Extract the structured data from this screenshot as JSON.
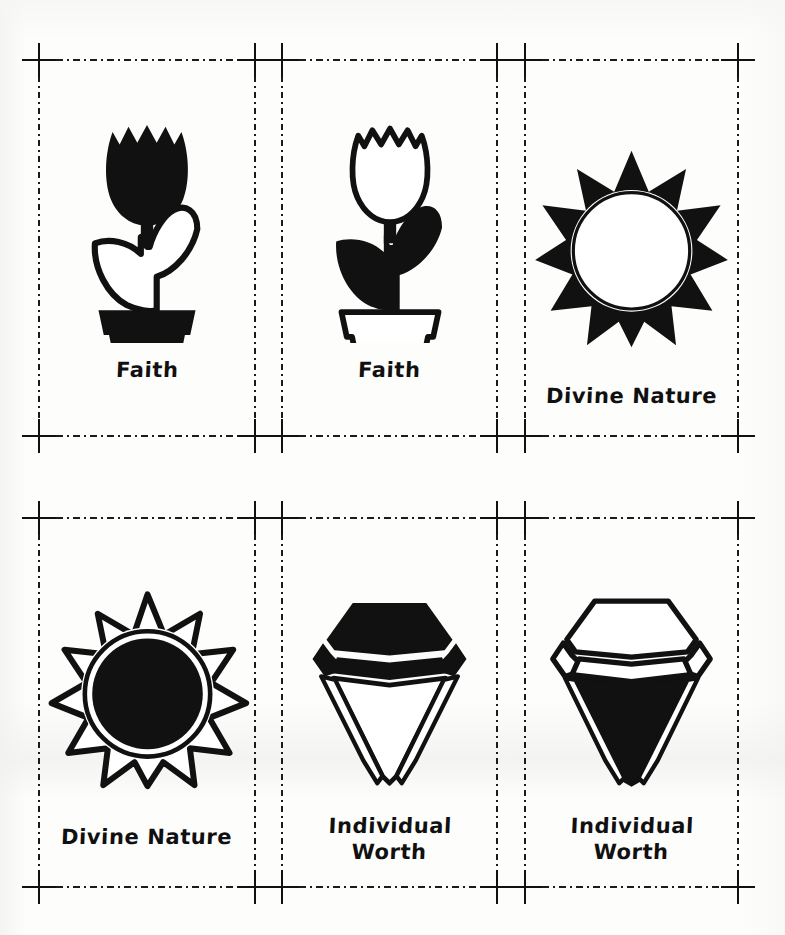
{
  "sheet": {
    "title": "Young Women Values Clip Art Sheet",
    "background_color": "#fdfdfc",
    "ink_color": "#111111",
    "columns": 3,
    "rows": 2
  },
  "guides": {
    "style": "dash-dot",
    "color": "#1b1b1b",
    "crop_mark_glyph": "plus-mark",
    "crop_marks_x": [
      39,
      255,
      282,
      497,
      525,
      738
    ],
    "crop_marks_y": [
      60,
      436,
      518,
      887
    ]
  },
  "cells": [
    {
      "id": "cell-1",
      "row": 1,
      "column": 1,
      "caption": "Faith",
      "icon_name": "potted-tulip-icon",
      "variant": "solid-bloom",
      "fill_style": "bloom-filled, leaves-outlined, pot-filled"
    },
    {
      "id": "cell-2",
      "row": 1,
      "column": 2,
      "caption": "Faith",
      "icon_name": "potted-tulip-icon",
      "variant": "outline-bloom",
      "fill_style": "bloom-outlined, leaves-filled, pot-outlined"
    },
    {
      "id": "cell-3",
      "row": 1,
      "column": 3,
      "caption": "Divine Nature",
      "icon_name": "sun-icon",
      "variant": "solid-rays",
      "fill_style": "rays-filled, center-outlined"
    },
    {
      "id": "cell-4",
      "row": 2,
      "column": 1,
      "caption": "Divine Nature",
      "icon_name": "sun-icon",
      "variant": "outline-rays",
      "fill_style": "rays-outlined, center-filled"
    },
    {
      "id": "cell-5",
      "row": 2,
      "column": 2,
      "caption": "Individual\nWorth",
      "icon_name": "diamond-icon",
      "variant": "solid-crown",
      "fill_style": "crown-filled, pavilion-outlined"
    },
    {
      "id": "cell-6",
      "row": 2,
      "column": 3,
      "caption": "Individual\nWorth",
      "icon_name": "diamond-icon",
      "variant": "outline-crown",
      "fill_style": "crown-outlined, pavilion-filled"
    }
  ]
}
